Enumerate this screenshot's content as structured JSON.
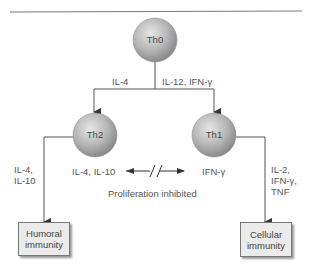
{
  "diagram": {
    "nodes": {
      "th0": {
        "label": "Th0"
      },
      "th2": {
        "label": "Th2"
      },
      "th1": {
        "label": "Th1"
      }
    },
    "edges": {
      "th0_to_th2": {
        "label": "IL-4"
      },
      "th0_to_th1": {
        "label": "IL-12, IFN-γ"
      },
      "th2_to_humoral": {
        "label_line1": "IL-4,",
        "label_line2": "IL-10"
      },
      "th1_to_cellular": {
        "label_line1": "IL-2,",
        "label_line2": "IFN-γ,",
        "label_line3": "TNF"
      },
      "cross_inhibition": {
        "left_label": "IL-4, IL-10",
        "right_label": "IFN-γ",
        "caption": "Proliferation inhibited"
      }
    },
    "outcomes": {
      "humoral": {
        "line1": "Humoral",
        "line2": "immunity"
      },
      "cellular": {
        "line1": "Cellular",
        "line2": "immunity"
      }
    },
    "colors": {
      "node_fill": "#b5b5b5",
      "box_fill": "#ebebeb",
      "line": "#555555"
    }
  }
}
